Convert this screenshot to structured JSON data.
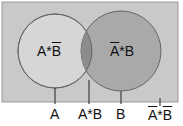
{
  "diagram": {
    "type": "venn",
    "colors": {
      "universe_fill": "#c8c8c8",
      "circle_a_fill": "#d4d4d4",
      "circle_b_fill": "#a8a8a8",
      "intersection_fill": "#8e8e8e",
      "stroke": "#555555"
    },
    "regions": {
      "a_not_b": {
        "pre": "A*",
        "over": "B"
      },
      "not_a_b": {
        "over": "A",
        "post": "*B"
      }
    },
    "pointer_labels": {
      "a": "A",
      "a_and_b": "A*B",
      "b": "B",
      "not_a_not_b": {
        "over1": "A",
        "mid": "*",
        "over2": "B"
      }
    }
  }
}
